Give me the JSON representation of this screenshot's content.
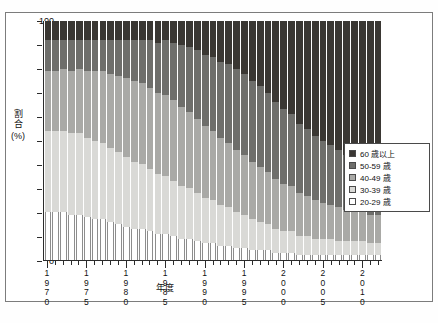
{
  "top_caption": "",
  "bottom_caption": {
    "badge": "",
    "text": ""
  },
  "chart_data": {
    "type": "bar",
    "subtype": "stacked-100-percent",
    "title": "",
    "xlabel": "年度",
    "ylabel": "割合(%)",
    "ylim": [
      0,
      100
    ],
    "ytick_labels": [
      "0",
      "10",
      "20",
      "30",
      "40",
      "50",
      "60",
      "70",
      "80",
      "90",
      "100"
    ],
    "grid": false,
    "legend_position": "right",
    "legend_entries": [
      "60 歳以上",
      "50-59 歳",
      "40-49 歳",
      "30-39 歳",
      "20-29 歳"
    ],
    "categories": [
      "1970",
      "1971",
      "1972",
      "1973",
      "1974",
      "1975",
      "1976",
      "1977",
      "1978",
      "1979",
      "1980",
      "1981",
      "1982",
      "1983",
      "1984",
      "1985",
      "1986",
      "1987",
      "1988",
      "1989",
      "1990",
      "1991",
      "1992",
      "1993",
      "1994",
      "1995",
      "1996",
      "1997",
      "1998",
      "1999",
      "2000",
      "2001",
      "2002",
      "2003",
      "2004",
      "2005",
      "2006",
      "2007",
      "2008",
      "2009",
      "2010",
      "2011",
      "2012"
    ],
    "x_major_ticks": [
      "1970",
      "1975",
      "1980",
      "1985",
      "1990",
      "1995",
      "2000",
      "2005",
      "2010"
    ],
    "series": [
      {
        "name": "20-29 歳",
        "color": "#ffffff",
        "values": [
          20,
          20,
          20,
          19,
          19,
          18,
          17,
          17,
          16,
          15,
          14,
          13,
          13,
          12,
          11,
          11,
          10,
          9,
          9,
          8,
          7,
          7,
          6,
          6,
          5,
          5,
          4,
          4,
          4,
          3,
          3,
          3,
          2,
          2,
          2,
          2,
          2,
          2,
          2,
          2,
          2,
          2,
          2
        ]
      },
      {
        "name": "30-39 歳",
        "color": "#d9d9d6",
        "values": [
          34,
          34,
          34,
          34,
          34,
          33,
          33,
          32,
          31,
          30,
          29,
          28,
          27,
          26,
          25,
          24,
          23,
          22,
          21,
          20,
          19,
          18,
          17,
          16,
          15,
          14,
          13,
          12,
          11,
          10,
          9,
          9,
          8,
          8,
          7,
          7,
          7,
          6,
          6,
          6,
          6,
          5,
          5
        ]
      },
      {
        "name": "40-49 歳",
        "color": "#a9a9a6",
        "values": [
          25,
          25,
          26,
          26,
          27,
          28,
          29,
          30,
          31,
          32,
          33,
          34,
          34,
          34,
          34,
          34,
          34,
          33,
          32,
          31,
          30,
          29,
          28,
          27,
          26,
          25,
          24,
          23,
          22,
          21,
          20,
          19,
          18,
          17,
          16,
          15,
          14,
          14,
          13,
          13,
          12,
          12,
          12
        ]
      },
      {
        "name": "50-59 歳",
        "color": "#6e6e6b",
        "values": [
          13,
          13,
          12,
          13,
          12,
          13,
          13,
          13,
          14,
          15,
          16,
          17,
          18,
          20,
          21,
          23,
          24,
          26,
          27,
          29,
          30,
          31,
          32,
          33,
          34,
          34,
          34,
          34,
          33,
          32,
          31,
          30,
          29,
          28,
          27,
          26,
          25,
          24,
          23,
          22,
          21,
          21,
          20
        ]
      },
      {
        "name": "60 歳以上",
        "color": "#3a3733",
        "values": [
          8,
          8,
          8,
          8,
          8,
          8,
          8,
          8,
          8,
          8,
          8,
          8,
          8,
          8,
          9,
          8,
          9,
          10,
          11,
          12,
          14,
          15,
          17,
          18,
          20,
          22,
          25,
          27,
          30,
          34,
          37,
          39,
          43,
          45,
          48,
          50,
          52,
          54,
          56,
          57,
          59,
          60,
          61
        ]
      }
    ]
  }
}
